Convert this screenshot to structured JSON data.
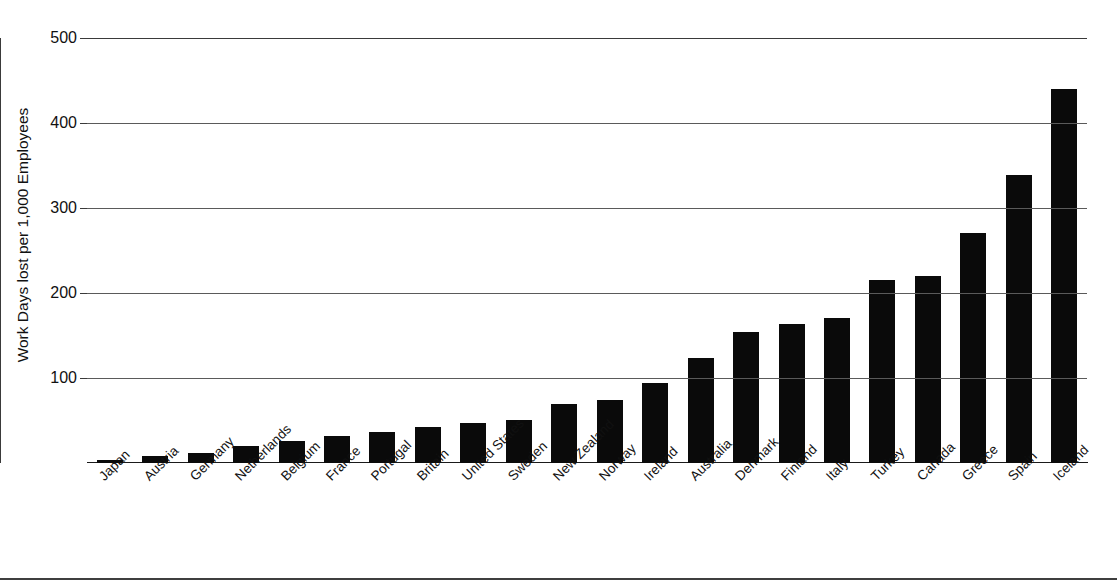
{
  "chart_data": {
    "type": "bar",
    "title": "",
    "xlabel": "",
    "ylabel": "Work Days lost per 1,000 Employees",
    "ylim": [
      0,
      500
    ],
    "yticks": [
      100,
      200,
      300,
      400,
      500
    ],
    "ytick_labels": [
      "100",
      "200",
      "300",
      "400",
      "500"
    ],
    "grid": true,
    "legend": "none",
    "bar_color": "#0a0a0a",
    "categories": [
      "Japan",
      "Austria",
      "Germany",
      "Netherlands",
      "Belgium",
      "France",
      "Portugal",
      "Britain",
      "United States",
      "Sweden",
      "New Zealand",
      "Norway",
      "Ireland",
      "Australia",
      "Denmark",
      "Finland",
      "Italy",
      "Turkey",
      "Canada",
      "Greece",
      "Spain",
      "Iceland"
    ],
    "values": [
      3,
      8,
      12,
      20,
      26,
      32,
      37,
      42,
      47,
      51,
      70,
      74,
      94,
      123,
      154,
      164,
      171,
      215,
      220,
      271,
      339,
      440
    ]
  }
}
